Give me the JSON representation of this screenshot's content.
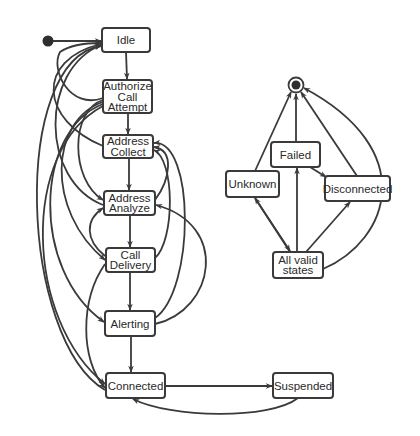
{
  "colors": {
    "stroke": "#3a3a3a",
    "text": "#2a2a2a",
    "background": "#ffffff"
  },
  "states": {
    "idle": {
      "lines": [
        "Idle"
      ]
    },
    "authorize": {
      "lines": [
        "Authorize",
        "Call",
        "Attempt"
      ]
    },
    "collect": {
      "lines": [
        "Address",
        "Collect"
      ]
    },
    "analyze": {
      "lines": [
        "Address",
        "Analyze"
      ]
    },
    "delivery": {
      "lines": [
        "Call",
        "Delivery"
      ]
    },
    "alerting": {
      "lines": [
        "Alerting"
      ]
    },
    "connected": {
      "lines": [
        "Connected"
      ]
    },
    "suspended": {
      "lines": [
        "Suspended"
      ]
    },
    "failed": {
      "lines": [
        "Failed"
      ]
    },
    "unknown": {
      "lines": [
        "Unknown"
      ]
    },
    "disconnected": {
      "lines": [
        "Disconnected"
      ]
    },
    "allvalid": {
      "lines": [
        "All valid",
        "states"
      ]
    }
  },
  "pseudostates": {
    "initial": "initial-state",
    "final": "final-state"
  },
  "transitions": [
    {
      "from": "initial",
      "to": "idle"
    },
    {
      "from": "idle",
      "to": "authorize"
    },
    {
      "from": "authorize",
      "to": "collect"
    },
    {
      "from": "collect",
      "to": "analyze"
    },
    {
      "from": "analyze",
      "to": "delivery"
    },
    {
      "from": "delivery",
      "to": "alerting"
    },
    {
      "from": "alerting",
      "to": "connected"
    },
    {
      "from": "connected",
      "to": "suspended"
    },
    {
      "from": "suspended",
      "to": "connected"
    },
    {
      "from": "authorize",
      "to": "idle"
    },
    {
      "from": "collect",
      "to": "idle"
    },
    {
      "from": "analyze",
      "to": "idle"
    },
    {
      "from": "connected",
      "to": "idle"
    },
    {
      "from": "authorize",
      "to": "analyze"
    },
    {
      "from": "authorize",
      "to": "delivery"
    },
    {
      "from": "authorize",
      "to": "alerting"
    },
    {
      "from": "authorize",
      "to": "connected"
    },
    {
      "from": "delivery",
      "to": "analyze"
    },
    {
      "from": "delivery",
      "to": "collect"
    },
    {
      "from": "delivery",
      "to": "connected"
    },
    {
      "from": "alerting",
      "to": "collect"
    },
    {
      "from": "alerting",
      "to": "analyze"
    },
    {
      "from": "analyze",
      "to": "collect"
    },
    {
      "from": "unknown",
      "to": "final"
    },
    {
      "from": "failed",
      "to": "final"
    },
    {
      "from": "disconnected",
      "to": "final"
    },
    {
      "from": "allvalid",
      "to": "final"
    },
    {
      "from": "failed",
      "to": "disconnected"
    },
    {
      "from": "allvalid",
      "to": "unknown"
    },
    {
      "from": "unknown",
      "to": "allvalid"
    },
    {
      "from": "allvalid",
      "to": "failed"
    },
    {
      "from": "allvalid",
      "to": "disconnected"
    }
  ]
}
